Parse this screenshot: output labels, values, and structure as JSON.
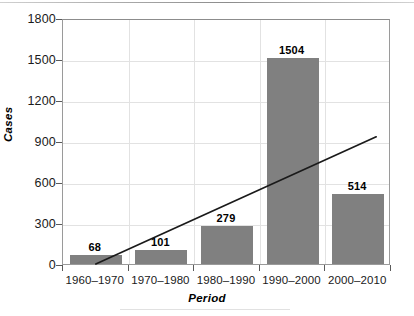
{
  "chart_data": {
    "type": "bar",
    "title": "",
    "xlabel": "Period",
    "ylabel": "Cases",
    "categories": [
      "1960–1970",
      "1970–1980",
      "1980–1990",
      "1990–2000",
      "2000–2010"
    ],
    "values": [
      68,
      101,
      279,
      1504,
      514
    ],
    "value_labels": [
      "68",
      "101",
      "279",
      "1504",
      "514"
    ],
    "ylim": [
      0,
      1800
    ],
    "yticks": [
      0,
      300,
      600,
      900,
      1200,
      1500,
      1800
    ],
    "ytick_labels": [
      "0",
      "300",
      "600",
      "900",
      "1200",
      "1500",
      "1800"
    ],
    "grid": "horizontal-and-vertical",
    "legend": "none",
    "series": [
      {
        "name": "Cases",
        "type": "bar",
        "values": [
          68,
          101,
          279,
          1504,
          514
        ],
        "color": "#808080"
      },
      {
        "name": "Trend line",
        "type": "line",
        "color": "#1a1a1a",
        "start": {
          "x_category": "1960–1970",
          "y": 15
        },
        "end": {
          "x_category": "2000–2010",
          "y": 945
        }
      }
    ]
  },
  "axes": {
    "y_label": "Cases",
    "x_label": "Period"
  },
  "colors": {
    "bar_fill": "#808080",
    "trend_line": "#1a1a1a",
    "grid": "#e2e2e2",
    "frame": "#9a9a9a",
    "text": "#1a1a1a",
    "background": "#ffffff"
  }
}
